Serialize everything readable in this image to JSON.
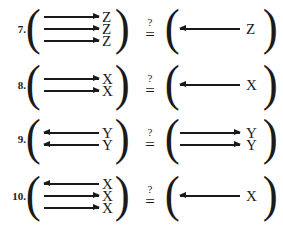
{
  "problems": [
    {
      "number": "7.",
      "left": [
        {
          "direction": "right",
          "letter": "Z"
        },
        {
          "direction": "right",
          "letter": "Z"
        },
        {
          "direction": "right",
          "letter": "Z"
        }
      ],
      "relation": {
        "question": "?",
        "symbol": "="
      },
      "right": [
        {
          "direction": "left",
          "letter": "Z"
        }
      ]
    },
    {
      "number": "8.",
      "left": [
        {
          "direction": "right",
          "letter": "X"
        },
        {
          "direction": "right",
          "letter": "X"
        }
      ],
      "relation": {
        "question": "?",
        "symbol": "="
      },
      "right": [
        {
          "direction": "left",
          "letter": "X"
        }
      ]
    },
    {
      "number": "9.",
      "left": [
        {
          "direction": "left",
          "letter": "Y"
        },
        {
          "direction": "left",
          "letter": "Y"
        }
      ],
      "relation": {
        "question": "?",
        "symbol": "="
      },
      "right": [
        {
          "direction": "right",
          "letter": "Y"
        },
        {
          "direction": "right",
          "letter": "Y"
        }
      ]
    },
    {
      "number": "10.",
      "left": [
        {
          "direction": "left",
          "letter": "X"
        },
        {
          "direction": "right",
          "letter": "X"
        },
        {
          "direction": "right",
          "letter": "X"
        }
      ],
      "relation": {
        "question": "?",
        "symbol": "="
      },
      "right": [
        {
          "direction": "left",
          "letter": "X"
        }
      ]
    }
  ],
  "glyphs": {
    "open_paren": "(",
    "close_paren": ")"
  }
}
